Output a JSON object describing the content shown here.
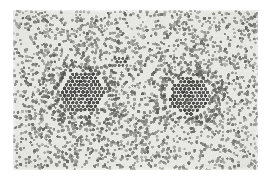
{
  "figure": {
    "kind": "grayscale-micrograph",
    "caption": "",
    "canvas": {
      "width": 269,
      "height": 185
    },
    "margins": {
      "background": "#ffffff"
    },
    "plate": {
      "x": 13,
      "y": 10,
      "width": 245,
      "height": 160,
      "background": "#ebebe7",
      "edge_fade": true
    },
    "palette": {
      "plate_background": "#ebebe7",
      "particle_dark": "#3f3f3d",
      "particle_mid": "#6e6e6a",
      "particle_light": "#9a9a95",
      "page_background": "#ffffff"
    }
  },
  "chart_data": {
    "type": "scatter",
    "xlabel": "",
    "ylabel": "",
    "xlim": [
      0,
      245
    ],
    "ylim": [
      0,
      160
    ],
    "grid": false,
    "legend": "none",
    "units": "pixels (plate-local coordinates)",
    "background_field": {
      "name": "dispersed particles",
      "count": 2350,
      "distribution": "random-uniform with local density fluctuations",
      "particle_diameter_px": 2.6,
      "fill_color": "#6e6e6a",
      "density_modulation": {
        "type": "multi-blob",
        "blobs": [
          {
            "cx": 60,
            "cy": 30,
            "r": 55,
            "gain": 0.55
          },
          {
            "cx": 175,
            "cy": 26,
            "r": 58,
            "gain": 0.5
          },
          {
            "cx": 38,
            "cy": 118,
            "r": 60,
            "gain": 0.6
          },
          {
            "cx": 128,
            "cy": 138,
            "r": 62,
            "gain": 0.55
          },
          {
            "cx": 214,
            "cy": 112,
            "r": 55,
            "gain": 0.5
          },
          {
            "cx": 120,
            "cy": 72,
            "r": 40,
            "gain": -0.35
          },
          {
            "cx": 232,
            "cy": 62,
            "r": 34,
            "gain": -0.3
          }
        ]
      }
    },
    "clusters": [
      {
        "id": "cluster-left",
        "label": "left hexagonal domain",
        "cx": 70,
        "cy": 82,
        "radius_px": 27,
        "lattice": "hexagonal-close-packed",
        "lattice_spacing_px": 4.1,
        "particle_diameter_px": 3.4,
        "particle_count": 118,
        "fill_color": "#3f3f3d",
        "halo": {
          "radius_px": 42,
          "extra_particles": 120,
          "fill_color": "#5e5e5a"
        }
      },
      {
        "id": "cluster-right",
        "label": "right hexagonal domain",
        "cx": 176,
        "cy": 86,
        "radius_px": 25,
        "lattice": "hexagonal-close-packed",
        "lattice_spacing_px": 4.1,
        "particle_diameter_px": 3.4,
        "particle_count": 104,
        "fill_color": "#3f3f3d",
        "halo": {
          "radius_px": 40,
          "extra_particles": 110,
          "fill_color": "#5e5e5a"
        }
      },
      {
        "id": "cluster-satellite",
        "label": "small satellite cluster",
        "cx": 108,
        "cy": 52,
        "radius_px": 7,
        "lattice": "hexagonal-close-packed",
        "lattice_spacing_px": 3.9,
        "particle_diameter_px": 3.0,
        "particle_count": 11,
        "fill_color": "#4a4a46",
        "halo": {
          "radius_px": 0,
          "extra_particles": 0,
          "fill_color": "#5e5e5a"
        }
      }
    ]
  }
}
